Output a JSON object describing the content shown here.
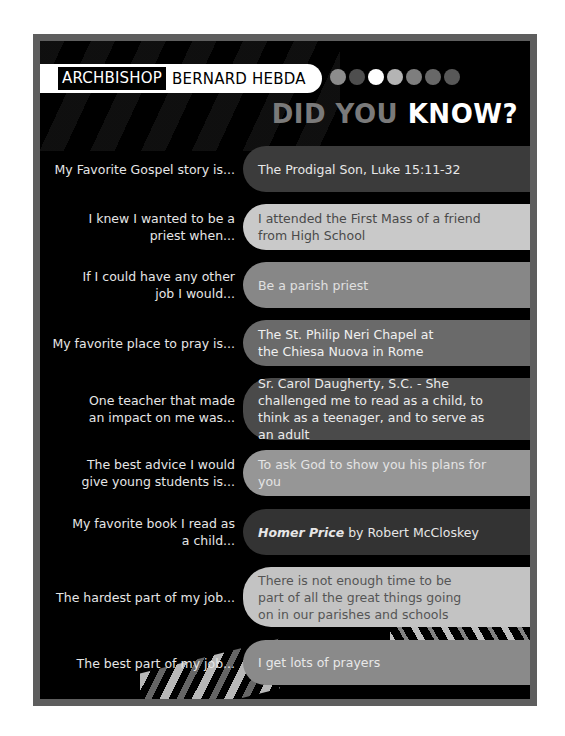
{
  "header": {
    "label": "ARCHBISHOP",
    "name": "BERNARD HEBDA",
    "headline_part1": "DID YOU",
    "headline_part2": "KNOW?",
    "dots": [
      "#8c8c8c",
      "#4e4e4e",
      "#ffffff",
      "#b4b4b4",
      "#7e7e7e",
      "#686868",
      "#585858"
    ]
  },
  "rows": [
    {
      "question": "My Favorite Gospel story is...",
      "answer": "The Prodigal Son, Luke 15:11-32",
      "bg": "#3b3b3b",
      "fg": "#e8e8e8"
    },
    {
      "question": "I knew I wanted to be a priest when...",
      "answer": "I attended the First Mass of a friend from High School",
      "bg": "#c9c9c9",
      "fg": "#4a4a4a"
    },
    {
      "question": "If I could have any other job I would...",
      "answer": "Be a parish priest",
      "bg": "#878787",
      "fg": "#e0e0e0"
    },
    {
      "question": "My favorite place to pray is...",
      "answer": "The St. Philip Neri Chapel at the Chiesa Nuova in Rome",
      "bg": "#6a6a6a",
      "fg": "#f0f0f0"
    },
    {
      "question": "One teacher that made an impact on me was...",
      "answer": "Sr. Carol Daugherty, S.C. - She challenged me to read as a child, to think as a teenager, and to serve as an adult",
      "bg": "#4a4a4a",
      "fg": "#ececec"
    },
    {
      "question": "The best advice I would give young students is...",
      "answer": "To ask God to show you his plans for you",
      "bg": "#969696",
      "fg": "#e4e4e4"
    },
    {
      "question": "My favorite book I read as a child...",
      "answer_title": "Homer Price",
      "answer": " by Robert McCloskey",
      "bg": "#333333",
      "fg": "#e6e6e6"
    },
    {
      "question": "The hardest part of my job...",
      "answer": "There is not enough time to be part of all the great things going on in our parishes and schools",
      "bg": "#c3c3c3",
      "fg": "#555555"
    },
    {
      "question": "The best part of my job...",
      "answer": "I get lots of prayers",
      "bg": "#8a8a8a",
      "fg": "#e8e8e8"
    }
  ]
}
